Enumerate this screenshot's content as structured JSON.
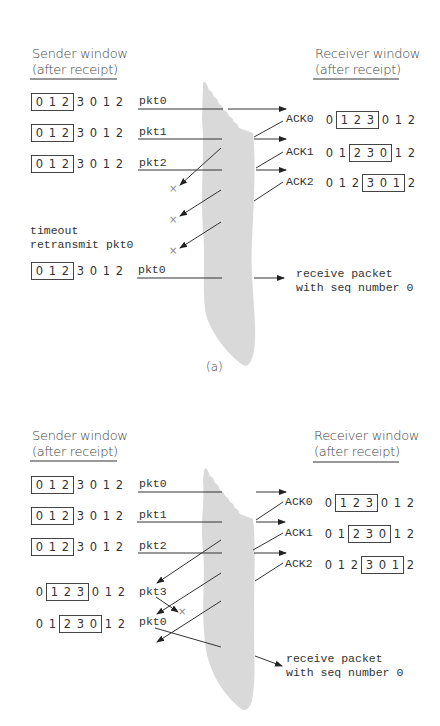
{
  "panels": [
    {
      "id": "a",
      "caption": "(a)",
      "sender_header": [
        "Sender window",
        "(after receipt)"
      ],
      "receiver_header": [
        "Receiver window",
        "(after receipt)"
      ],
      "sender_rows": [
        {
          "seq": [
            "0",
            "1",
            "2",
            "3",
            "0",
            "1",
            "2"
          ],
          "window": [
            0,
            3
          ],
          "packet": "pkt0"
        },
        {
          "seq": [
            "0",
            "1",
            "2",
            "3",
            "0",
            "1",
            "2"
          ],
          "window": [
            0,
            3
          ],
          "packet": "pkt1"
        },
        {
          "seq": [
            "0",
            "1",
            "2",
            "3",
            "0",
            "1",
            "2"
          ],
          "window": [
            0,
            3
          ],
          "packet": "pkt2"
        },
        {
          "seq": [
            "0",
            "1",
            "2",
            "3",
            "0",
            "1",
            "2"
          ],
          "window": [
            0,
            3
          ],
          "packet": "pkt0"
        }
      ],
      "receiver_rows": [
        {
          "ack": "ACK0",
          "seq": [
            "0",
            "1",
            "2",
            "3",
            "0",
            "1",
            "2"
          ],
          "window": [
            1,
            4
          ]
        },
        {
          "ack": "ACK1",
          "seq": [
            "0",
            "1",
            "2",
            "3",
            "0",
            "1",
            "2"
          ],
          "window": [
            2,
            5
          ]
        },
        {
          "ack": "ACK2",
          "seq": [
            "0",
            "1",
            "2",
            "3",
            "0",
            "1",
            "2"
          ],
          "window": [
            3,
            6
          ]
        }
      ],
      "timeout_text": [
        "timeout",
        "retransmit pkt0"
      ],
      "lost_marker": "×",
      "receive_note": [
        "receive packet",
        "with seq number 0"
      ]
    },
    {
      "id": "b",
      "caption": "(b)",
      "sender_header": [
        "Sender window",
        "(after receipt)"
      ],
      "receiver_header": [
        "Receiver window",
        "(after receipt)"
      ],
      "sender_rows": [
        {
          "seq": [
            "0",
            "1",
            "2",
            "3",
            "0",
            "1",
            "2"
          ],
          "window": [
            0,
            3
          ],
          "packet": "pkt0"
        },
        {
          "seq": [
            "0",
            "1",
            "2",
            "3",
            "0",
            "1",
            "2"
          ],
          "window": [
            0,
            3
          ],
          "packet": "pkt1"
        },
        {
          "seq": [
            "0",
            "1",
            "2",
            "3",
            "0",
            "1",
            "2"
          ],
          "window": [
            0,
            3
          ],
          "packet": "pkt2"
        },
        {
          "seq": [
            "0",
            "1",
            "2",
            "3",
            "0",
            "1",
            "2"
          ],
          "window": [
            1,
            4
          ],
          "packet": "pkt3"
        },
        {
          "seq": [
            "0",
            "1",
            "2",
            "3",
            "0",
            "1",
            "2"
          ],
          "window": [
            2,
            5
          ],
          "packet": "pkt0"
        }
      ],
      "receiver_rows": [
        {
          "ack": "ACK0",
          "seq": [
            "0",
            "1",
            "2",
            "3",
            "0",
            "1",
            "2"
          ],
          "window": [
            1,
            4
          ]
        },
        {
          "ack": "ACK1",
          "seq": [
            "0",
            "1",
            "2",
            "3",
            "0",
            "1",
            "2"
          ],
          "window": [
            2,
            5
          ]
        },
        {
          "ack": "ACK2",
          "seq": [
            "0",
            "1",
            "2",
            "3",
            "0",
            "1",
            "2"
          ],
          "window": [
            3,
            6
          ]
        }
      ],
      "lost_marker": "×",
      "receive_note": [
        "receive packet",
        "with seq number 0"
      ]
    }
  ],
  "colors": {
    "channel": "#d9d9d9",
    "line": "#333333",
    "lost": "#888888"
  }
}
